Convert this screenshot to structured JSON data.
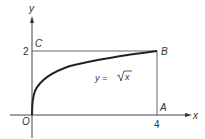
{
  "diagram": {
    "axes": {
      "x_label": "x",
      "y_label": "y",
      "origin_label": "O"
    },
    "ticks": {
      "x_tick": "4",
      "y_tick": "2"
    },
    "points": {
      "A": "A",
      "B": "B",
      "C": "C"
    },
    "curve": {
      "label_lhs": "y = ",
      "label_radicand": "x",
      "function": "y = sqrt(x)",
      "domain": [
        0,
        4
      ]
    },
    "colors": {
      "line": "#333333",
      "curve": "#222222",
      "text": "#333333"
    }
  }
}
